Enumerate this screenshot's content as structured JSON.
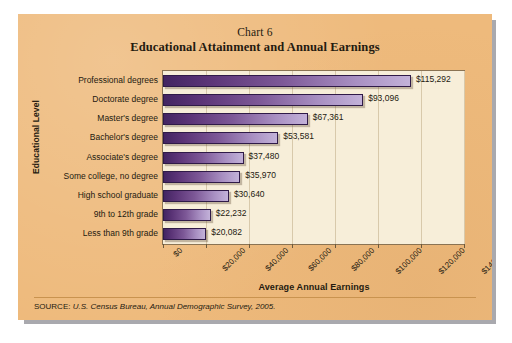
{
  "card": {
    "background_color": "#eeba7c",
    "plot_background_color": "#f7eed9",
    "bar_color_dark": "#432562",
    "bar_color_light": "#c3b2d9"
  },
  "header": {
    "chart_number": "Chart 6",
    "title": "Educational Attainment and Annual Earnings"
  },
  "source": {
    "prefix": "SOURCE:",
    "text": "U.S. Census Bureau, Annual Demographic Survey, 2005."
  },
  "chart_data": {
    "type": "bar",
    "orientation": "horizontal",
    "title": "Educational Attainment and Annual Earnings",
    "subtitle": "Chart 6",
    "xlabel": "Average Annual Earnings",
    "ylabel": "Educational Level",
    "xlim": [
      0,
      140000
    ],
    "grid": true,
    "legend": "none",
    "categories": [
      "Professional degrees",
      "Doctorate degree",
      "Master's degree",
      "Bachelor's degree",
      "Associate's degree",
      "Some college, no degree",
      "High school graduate",
      "9th to 12th grade",
      "Less than 9th grade"
    ],
    "values": [
      115292,
      93096,
      67361,
      53581,
      37480,
      35970,
      30640,
      22232,
      20082
    ],
    "value_labels": [
      "$115,292",
      "$93,096",
      "$67,361",
      "$53,581",
      "$37,480",
      "$35,970",
      "$30,640",
      "$22,232",
      "$20,082"
    ],
    "xticks": [
      0,
      20000,
      40000,
      60000,
      80000,
      100000,
      120000,
      140000
    ],
    "xtick_labels": [
      "$0",
      "$20,000",
      "$40,000",
      "$60,000",
      "$80,000",
      "$100,000",
      "$120,000",
      "$140,000"
    ]
  }
}
